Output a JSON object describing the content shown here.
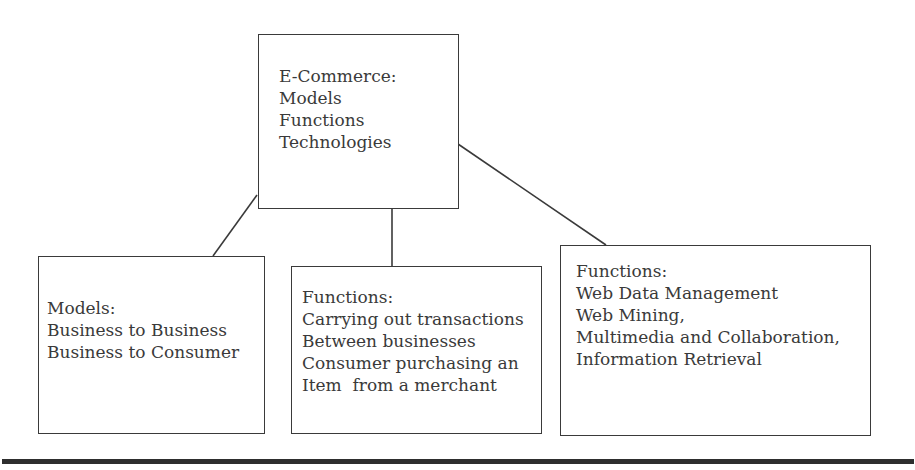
{
  "diagram": {
    "root": {
      "lines": [
        "E-Commerce:",
        "Models",
        "Functions",
        "Technologies"
      ]
    },
    "children": [
      {
        "id": "models",
        "lines": [
          "Models:",
          "Business to Business",
          "Business to Consumer"
        ]
      },
      {
        "id": "functions-center",
        "lines": [
          "Functions:",
          "Carrying out transactions",
          "Between businesses",
          "Consumer purchasing an",
          "Item  from a merchant"
        ]
      },
      {
        "id": "functions-right",
        "lines": [
          "Functions:",
          "Web Data Management",
          "Web Mining,",
          "Multimedia and Collaboration,",
          "Information Retrieval"
        ]
      }
    ],
    "colors": {
      "stroke": "#3a3a3a",
      "text": "#3a3a3a",
      "rule": "#2e2e2e",
      "background": "#ffffff"
    }
  }
}
